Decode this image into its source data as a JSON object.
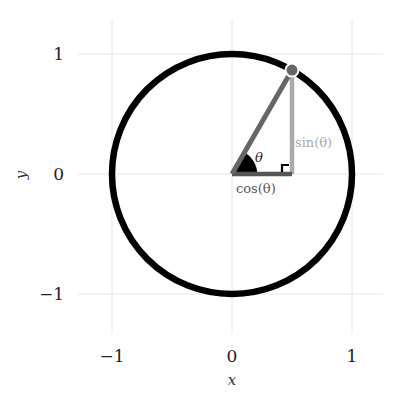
{
  "chart_data": {
    "type": "line",
    "title": "",
    "xlabel": "x",
    "ylabel": "y",
    "xlim": [
      -1.3,
      1.3
    ],
    "ylim": [
      -1.35,
      1.3
    ],
    "grid": true,
    "xticks": [
      -1,
      0,
      1
    ],
    "yticks": [
      -1,
      0,
      1
    ],
    "xtick_labels": [
      "−1",
      "0",
      "1"
    ],
    "ytick_labels": [
      "−1",
      "0",
      "1"
    ],
    "circle": {
      "center": [
        0,
        0
      ],
      "radius": 1,
      "color": "#000000"
    },
    "angle_deg": 60,
    "point": {
      "x": 0.5,
      "y": 0.866,
      "color": "#666666"
    },
    "segments": [
      {
        "name": "hypotenuse",
        "from": [
          0,
          0
        ],
        "to": [
          0.5,
          0.866
        ],
        "color": "#666666"
      },
      {
        "name": "cos-leg",
        "from": [
          0,
          0
        ],
        "to": [
          0.5,
          0
        ],
        "color": "#555555"
      },
      {
        "name": "sin-leg",
        "from": [
          0.5,
          0
        ],
        "to": [
          0.5,
          0.866
        ],
        "color": "#aaaaaa"
      }
    ],
    "annotations": {
      "theta": "θ",
      "sin": "sin(θ)",
      "cos": "cos(θ)"
    },
    "colors": {
      "grid": "#e6e6e6",
      "angle_wedge": "#000000",
      "sin_label": "#aaaaaa",
      "cos_label": "#555555",
      "theta_label": "#222222"
    }
  }
}
